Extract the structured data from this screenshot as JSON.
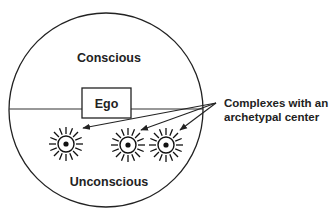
{
  "diagram": {
    "colors": {
      "stroke": "#222222",
      "text": "#222222",
      "background": "#ffffff"
    },
    "psyche_circle": {
      "cx": 106,
      "cy": 110,
      "r": 97
    },
    "divider": {
      "x1": 9,
      "x2": 203,
      "y": 109
    },
    "regions": {
      "conscious": {
        "label": "Conscious",
        "x": 109,
        "y": 62
      },
      "unconscious": {
        "label": "Unconscious",
        "x": 109,
        "y": 186
      }
    },
    "ego": {
      "label": "Ego",
      "x": 82,
      "y": 88,
      "width": 49,
      "height": 30
    },
    "complexes": [
      {
        "id": "complex-1",
        "cx": 66,
        "cy": 144
      },
      {
        "id": "complex-2",
        "cx": 128,
        "cy": 145
      },
      {
        "id": "complex-3",
        "cx": 166,
        "cy": 145
      }
    ],
    "complex_style": {
      "ring_radius": 8,
      "core_radius": 2.6,
      "ray_inner": 10,
      "ray_outer": 17,
      "ray_count": 16
    },
    "callout": {
      "label_line1": "Complexes with an",
      "label_line2": "archetypal center",
      "origin": {
        "x": 216,
        "y": 103
      },
      "arrow_tips": [
        {
          "x": 83,
          "y": 128
        },
        {
          "x": 141,
          "y": 130
        },
        {
          "x": 180,
          "y": 130
        }
      ]
    }
  }
}
